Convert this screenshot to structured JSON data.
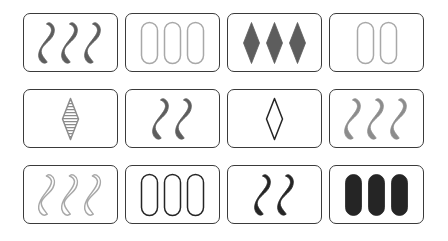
{
  "board": {
    "title": "Set card game board",
    "rows": 3,
    "columns": 4,
    "background_color": "#ffffff",
    "card_border_color": "#3a3a3a",
    "palette": {
      "dark_gray": "#5d5d5d",
      "medium_gray": "#8c8c8c",
      "light_gray": "#a8a8a8",
      "black": "#252525"
    },
    "cards": [
      {
        "position": "row1-col1",
        "count": 3,
        "shape": "squiggle",
        "shading": "solid",
        "color": "#5d5d5d",
        "label": "three solid dark gray squiggles"
      },
      {
        "position": "row1-col2",
        "count": 3,
        "shape": "oval",
        "shading": "open",
        "color": "#a8a8a8",
        "label": "three open light gray ovals"
      },
      {
        "position": "row1-col3",
        "count": 3,
        "shape": "diamond",
        "shading": "solid",
        "color": "#5d5d5d",
        "label": "three solid dark gray diamonds"
      },
      {
        "position": "row1-col4",
        "count": 2,
        "shape": "oval",
        "shading": "open",
        "color": "#a8a8a8",
        "label": "two open light gray ovals"
      },
      {
        "position": "row2-col1",
        "count": 1,
        "shape": "diamond",
        "shading": "striped",
        "color": "#8c8c8c",
        "label": "one striped gray diamond"
      },
      {
        "position": "row2-col2",
        "count": 2,
        "shape": "squiggle",
        "shading": "solid",
        "color": "#5d5d5d",
        "label": "two solid dark gray squiggles"
      },
      {
        "position": "row2-col3",
        "count": 1,
        "shape": "diamond",
        "shading": "open",
        "color": "#252525",
        "label": "one open black diamond"
      },
      {
        "position": "row2-col4",
        "count": 3,
        "shape": "squiggle",
        "shading": "solid",
        "color": "#8c8c8c",
        "label": "three solid medium gray squiggles"
      },
      {
        "position": "row3-col1",
        "count": 3,
        "shape": "squiggle",
        "shading": "open",
        "color": "#a8a8a8",
        "label": "three open light gray squiggles"
      },
      {
        "position": "row3-col2",
        "count": 3,
        "shape": "oval",
        "shading": "open",
        "color": "#252525",
        "label": "three open black ovals"
      },
      {
        "position": "row3-col3",
        "count": 2,
        "shape": "squiggle",
        "shading": "solid",
        "color": "#252525",
        "label": "two solid black squiggles"
      },
      {
        "position": "row3-col4",
        "count": 3,
        "shape": "oval",
        "shading": "solid",
        "color": "#252525",
        "label": "three solid black ovals"
      }
    ]
  }
}
